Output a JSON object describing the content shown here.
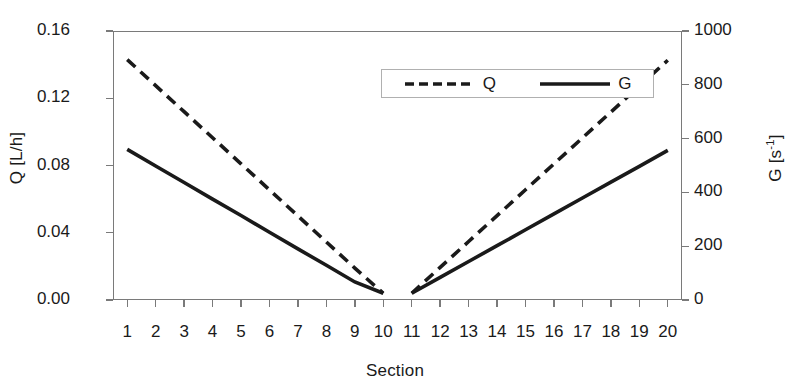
{
  "chart_data": {
    "type": "line",
    "title": "",
    "xlabel": "Section",
    "ylabel": "Q [L/h]",
    "y2label": "G [s-1]",
    "xlim": [
      0.5,
      20.5
    ],
    "ylim": [
      0.0,
      0.16
    ],
    "y2lim": [
      0,
      1000
    ],
    "grid": false,
    "legend_position": "top-center",
    "categories": [
      1,
      2,
      3,
      4,
      5,
      6,
      7,
      8,
      9,
      10,
      11,
      12,
      13,
      14,
      15,
      16,
      17,
      18,
      19,
      20
    ],
    "series": [
      {
        "name": "Q",
        "axis": "left",
        "style": "dashed",
        "color": "#1a1a1a",
        "values": [
          0.143,
          0.1275,
          0.112,
          0.0965,
          0.081,
          0.0655,
          0.05,
          0.0345,
          0.019,
          0.004,
          0.004,
          0.0194,
          0.0348,
          0.0502,
          0.0656,
          0.081,
          0.0964,
          0.1118,
          0.1272,
          0.1426
        ]
      },
      {
        "name": "G",
        "axis": "right",
        "style": "solid",
        "color": "#1a1a1a",
        "values": [
          560,
          498,
          437,
          375,
          314,
          252,
          190,
          129,
          67,
          25,
          25,
          84,
          143,
          202,
          261,
          320,
          379,
          438,
          497,
          556
        ]
      }
    ],
    "yticks": [
      "0.00",
      "0.04",
      "0.08",
      "0.12",
      "0.16"
    ],
    "ytick_values": [
      0.0,
      0.04,
      0.08,
      0.12,
      0.16
    ],
    "y2ticks": [
      "0",
      "200",
      "400",
      "600",
      "800",
      "1000"
    ],
    "y2tick_values": [
      0,
      200,
      400,
      600,
      800,
      1000
    ],
    "xticks": [
      "1",
      "2",
      "3",
      "4",
      "5",
      "6",
      "7",
      "8",
      "9",
      "10",
      "11",
      "12",
      "13",
      "14",
      "15",
      "16",
      "17",
      "18",
      "19",
      "20"
    ],
    "legend": [
      {
        "label": "Q",
        "style": "dashed"
      },
      {
        "label": "G",
        "style": "solid"
      }
    ]
  },
  "axes": {
    "y_left_title": "Q [L/h]",
    "y_right_title_main": "G [s",
    "y_right_title_sup": "-1",
    "y_right_title_tail": "]",
    "x_title": "Section"
  }
}
